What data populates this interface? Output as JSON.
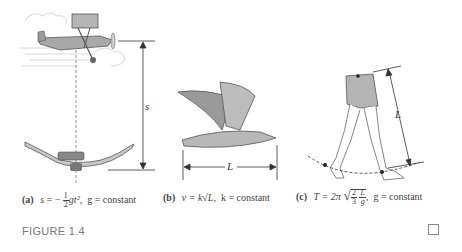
{
  "figure": {
    "label": "FIGURE 1.4",
    "panels": [
      {
        "id": "a",
        "tag": "(a)",
        "formula_lhs": "s",
        "formula_eq": " = −",
        "frac_num": "1",
        "frac_den": "2",
        "formula_rest": "gt²,",
        "condition": "g = constant",
        "dimension_label": "s",
        "illustration": "airplane-and-skydiver"
      },
      {
        "id": "b",
        "tag": "(b)",
        "formula": "v = k√L,",
        "condition": "k = constant",
        "dimension_label": "L",
        "illustration": "flying-seagull"
      },
      {
        "id": "c",
        "tag": "(c)",
        "formula_lhs": "T = 2π",
        "frac1_num": "2",
        "frac1_den": "3",
        "frac2_num": "L",
        "frac2_den": "g",
        "condition": "g = constant",
        "dimension_label": "L",
        "illustration": "walking-legs"
      }
    ]
  }
}
